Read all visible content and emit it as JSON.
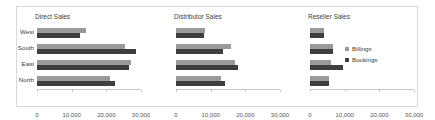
{
  "chart_data": {
    "type": "bar",
    "orientation": "horizontal",
    "title": "",
    "xlabel": "",
    "ylabel": "",
    "xlim": [
      0,
      30000
    ],
    "xticks": [
      0,
      10000,
      20000,
      30000
    ],
    "xtick_labels": [
      "0",
      "10,000",
      "20,000",
      "30,000"
    ],
    "categories": [
      "West",
      "South",
      "East",
      "North"
    ],
    "grid": false,
    "legend_position": "right",
    "legend": [
      "Billings",
      "Bookings"
    ],
    "colors": {
      "billings": "#9a9a9a",
      "bookings": "#3f3f3f",
      "axis": "#c8c8c8",
      "border": "#d9d9d9",
      "text": "#3a3a3a",
      "background": "#ffffff"
    },
    "panels": [
      {
        "title": "Direct Sales",
        "series": [
          {
            "name": "Billings",
            "values": [
              14000,
              25500,
              27000,
              21000
            ]
          },
          {
            "name": "Bookings",
            "values": [
              12500,
              28500,
              26500,
              22500
            ]
          }
        ]
      },
      {
        "title": "Distributor Sales",
        "series": [
          {
            "name": "Billings",
            "values": [
              8500,
              16000,
              17000,
              13000
            ]
          },
          {
            "name": "Bookings",
            "values": [
              8000,
              13500,
              18000,
              14000
            ]
          }
        ]
      },
      {
        "title": "Reseller Sales",
        "series": [
          {
            "name": "Billings",
            "values": [
              4000,
              6500,
              6000,
              5500
            ]
          },
          {
            "name": "Bookings",
            "values": [
              4000,
              6500,
              9500,
              5500
            ]
          }
        ]
      }
    ]
  }
}
